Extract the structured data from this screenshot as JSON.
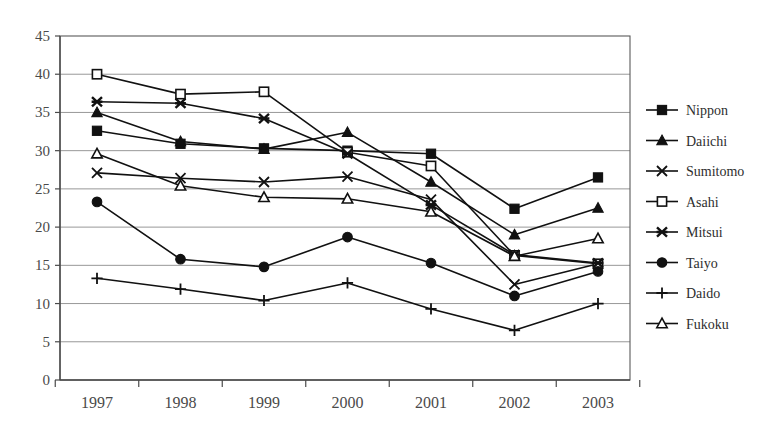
{
  "chart_data": {
    "type": "line",
    "title": "",
    "subtitle": "",
    "xlabel": "",
    "ylabel": "",
    "categories": [
      "1997",
      "1998",
      "1999",
      "2000",
      "2001",
      "2002",
      "2003"
    ],
    "x": [
      1997,
      1998,
      1999,
      2000,
      2001,
      2002,
      2003
    ],
    "ylim": [
      0,
      45
    ],
    "ytick_labels": [
      "0",
      "5",
      "10",
      "15",
      "20",
      "25",
      "30",
      "35",
      "40",
      "45"
    ],
    "ytick_values": [
      0,
      5,
      10,
      15,
      20,
      25,
      30,
      35,
      40,
      45
    ],
    "grid": "horizontal",
    "legend_position": "right",
    "series": [
      {
        "name": "Nippon",
        "marker": "filled-square",
        "values": [
          32.6,
          30.9,
          30.3,
          30.0,
          29.6,
          22.4,
          26.5
        ]
      },
      {
        "name": "Daiichi",
        "marker": "filled-triangle",
        "values": [
          35.0,
          31.2,
          30.2,
          32.4,
          25.9,
          19.0,
          22.5
        ]
      },
      {
        "name": "Sumitomo",
        "marker": "cross-x",
        "values": [
          27.1,
          26.4,
          25.9,
          26.6,
          23.6,
          12.5,
          15.2
        ]
      },
      {
        "name": "Asahi",
        "marker": "open-square",
        "values": [
          40.0,
          37.4,
          37.7,
          29.8,
          28.0,
          16.3,
          15.2
        ]
      },
      {
        "name": "Mitsui",
        "marker": "bold-star",
        "values": [
          36.4,
          36.2,
          34.2,
          29.6,
          22.9,
          16.4,
          15.3
        ]
      },
      {
        "name": "Taiyo",
        "marker": "filled-circle",
        "values": [
          23.3,
          15.8,
          14.8,
          18.7,
          15.3,
          11.0,
          14.2
        ]
      },
      {
        "name": "Daido",
        "marker": "plus",
        "values": [
          13.3,
          11.9,
          10.4,
          12.7,
          9.3,
          6.5,
          10.0
        ]
      },
      {
        "name": "Fukoku",
        "marker": "open-triangle",
        "values": [
          29.6,
          25.4,
          23.9,
          23.7,
          22.0,
          16.2,
          18.5
        ]
      }
    ]
  },
  "legend": {
    "entries": [
      {
        "label": "Nippon"
      },
      {
        "label": "Daiichi"
      },
      {
        "label": "Sumitomo"
      },
      {
        "label": "Asahi"
      },
      {
        "label": "Mitsui"
      },
      {
        "label": "Taiyo"
      },
      {
        "label": "Daido"
      },
      {
        "label": "Fukoku"
      }
    ]
  },
  "style": {
    "line_color": "#111111",
    "grid_color": "#8c8c8c",
    "text_color": "#4a4a4a",
    "background": "#ffffff"
  }
}
